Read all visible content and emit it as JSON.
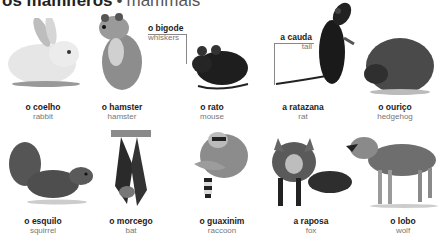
{
  "title": {
    "pt": "os mamíferos",
    "separator": "•",
    "en": "mammals"
  },
  "callouts": [
    {
      "pt": "o bigode",
      "en": "whiskers"
    },
    {
      "pt": "a cauda",
      "en": "tail"
    }
  ],
  "animals": [
    {
      "pt": "o coelho",
      "en": "rabbit",
      "icon": "rabbit-image"
    },
    {
      "pt": "o hamster",
      "en": "hamster",
      "icon": "hamster-image"
    },
    {
      "pt": "o rato",
      "en": "mouse",
      "icon": "mouse-image"
    },
    {
      "pt": "a ratazana",
      "en": "rat",
      "icon": "rat-image"
    },
    {
      "pt": "o ouriço",
      "en": "hedgehog",
      "icon": "hedgehog-image"
    },
    {
      "pt": "o esquilo",
      "en": "squirrel",
      "icon": "squirrel-image"
    },
    {
      "pt": "o morcego",
      "en": "bat",
      "icon": "bat-image"
    },
    {
      "pt": "o guaxinim",
      "en": "raccoon",
      "icon": "raccoon-image"
    },
    {
      "pt": "a raposa",
      "en": "fox",
      "icon": "fox-image"
    },
    {
      "pt": "o lobo",
      "en": "wolf",
      "icon": "wolf-image"
    }
  ]
}
